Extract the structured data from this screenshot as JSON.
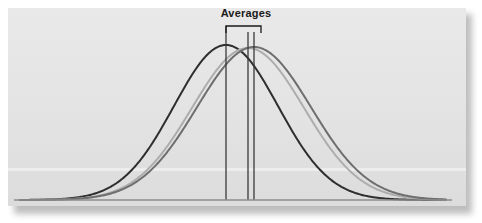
{
  "figure": {
    "label": "Averages",
    "panel_color": "#e4e4e4",
    "background_color": "#ffffff",
    "shadow_color": "#a8a8a8",
    "baseline_color": "#8c8c8c",
    "bracket_color": "#1a1a1a",
    "marker_line_color": "#3a3a3a"
  },
  "chart_data": {
    "type": "line",
    "title": "Averages",
    "xlabel": "",
    "ylabel": "",
    "grid": false,
    "legend": "none",
    "annotations": [
      {
        "text": "Averages",
        "type": "bracket-label",
        "bracket_x_start": 226,
        "bracket_x_end": 261,
        "bracket_y": 26,
        "label_x": 246,
        "label_y": 14
      }
    ],
    "axis": {
      "x_range": [
        20,
        446
      ],
      "y_baseline": 200,
      "y_peak": 45
    },
    "vertical_mean_markers": [
      {
        "series": "curve-1",
        "x": 226,
        "y_top": 26,
        "y_bottom": 200,
        "color": "#3a3a3a"
      },
      {
        "series": "curve-2",
        "x": 248,
        "y_top": 32,
        "y_bottom": 200,
        "color": "#3a3a3a"
      },
      {
        "series": "curve-3",
        "x": 254,
        "y_top": 32,
        "y_bottom": 200,
        "color": "#3a3a3a"
      }
    ],
    "series": [
      {
        "name": "curve-1",
        "label": "Distribution 1",
        "color": "#2e2e2e",
        "line_width": 2.0,
        "distribution": "normal",
        "mean": 226,
        "sigma": 52,
        "peak_y": 45,
        "baseline_y": 200,
        "x_start": 20,
        "x_end": 446
      },
      {
        "name": "curve-2",
        "label": "Distribution 2",
        "color": "#adadad",
        "line_width": 2.0,
        "distribution": "normal",
        "mean": 248,
        "sigma": 56,
        "peak_y": 48,
        "baseline_y": 200,
        "x_start": 20,
        "x_end": 446
      },
      {
        "name": "curve-3",
        "label": "Distribution 3",
        "color": "#6e6e6e",
        "line_width": 2.0,
        "distribution": "normal",
        "mean": 254,
        "sigma": 57,
        "peak_y": 47,
        "baseline_y": 200,
        "x_start": 20,
        "x_end": 446
      }
    ]
  }
}
